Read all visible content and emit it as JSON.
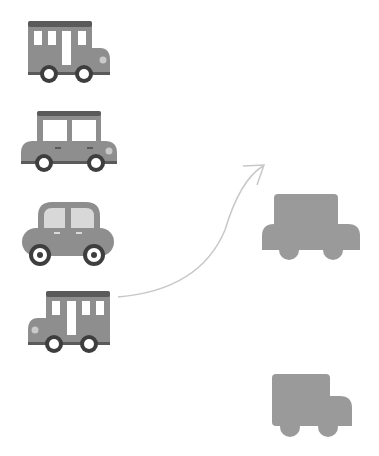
{
  "puzzle": {
    "type": "shadow-matching",
    "colors": {
      "body": "#8e8e8e",
      "roof": "#5a5a5a",
      "window": "#ffffff",
      "window_tint": "#d8d8d8",
      "wheel": "#3e3e3e",
      "hub": "#ffffff",
      "light": "#c9c9c9",
      "shadow": "#9a9a9a",
      "arrow": "#c8c8c8"
    },
    "options": [
      {
        "id": "bus-right",
        "label": "bus facing right"
      },
      {
        "id": "car-boxy",
        "label": "boxy car"
      },
      {
        "id": "car-round",
        "label": "round car"
      },
      {
        "id": "bus-left",
        "label": "bus facing left"
      }
    ],
    "shadows": [
      {
        "id": "shadow-car",
        "label": "car silhouette"
      },
      {
        "id": "shadow-truck",
        "label": "truck silhouette"
      }
    ],
    "connection": {
      "from": "bus-left",
      "to": "shadow-car"
    }
  }
}
